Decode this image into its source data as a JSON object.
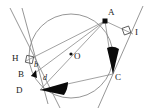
{
  "figure": {
    "type": "geometry-diagram",
    "background_color": "#ffffff",
    "stroke_color": "#777777",
    "marker_fill": "#000000",
    "label_color": "#1a1a1a"
  },
  "circle": {
    "label": "O",
    "center": {
      "x": 71,
      "y": 56
    },
    "radius": 42,
    "center_dot": true
  },
  "points": [
    {
      "name": "A",
      "label": "A",
      "x": 105,
      "y": 21,
      "marker": "filled-square",
      "label_dx": 3,
      "label_dy": -11
    },
    {
      "name": "I",
      "label": "I",
      "x": 133,
      "y": 34,
      "marker": "none",
      "label_dx": 4,
      "label_dy": -4
    },
    {
      "name": "C",
      "label": "C",
      "x": 113,
      "y": 74,
      "marker": "none",
      "label_dx": 3,
      "label_dy": 3
    },
    {
      "name": "O",
      "label": "O",
      "x": 71,
      "y": 56,
      "marker": "dot",
      "label_dx": 3,
      "label_dy": -3
    },
    {
      "name": "H",
      "label": "H",
      "x": 26,
      "y": 61,
      "marker": "none",
      "label_dx": -13,
      "label_dy": 0
    },
    {
      "name": "B",
      "label": "B",
      "x": 31,
      "y": 76,
      "marker": "none",
      "label_dx": -12,
      "label_dy": 2
    },
    {
      "name": "D",
      "label": "D",
      "x": 40,
      "y": 90,
      "marker": "none",
      "label_dx": -13,
      "label_dy": 3
    }
  ],
  "angle_labels": [
    {
      "name": "b",
      "label": "b",
      "x": 35,
      "y": 66
    },
    {
      "name": "d",
      "label": "d",
      "x": 44,
      "y": 79
    }
  ],
  "angle_markers": [
    {
      "name": "right-angle-H",
      "type": "square",
      "vertex": "H"
    },
    {
      "name": "right-angle-I",
      "type": "square",
      "vertex": "I"
    },
    {
      "name": "filled-angle-C",
      "type": "filled-wedge",
      "vertex": "C"
    },
    {
      "name": "filled-angle-D",
      "type": "filled-wedge",
      "vertex": "D"
    }
  ],
  "segments": [
    {
      "name": "A-H",
      "from": "A",
      "to": "H"
    },
    {
      "name": "A-B",
      "from": "A",
      "to": "B"
    },
    {
      "name": "A-D",
      "from": "A",
      "to": "D"
    },
    {
      "name": "A-C",
      "from": "A",
      "to": "C"
    },
    {
      "name": "A-I",
      "from": "A",
      "to": "I"
    },
    {
      "name": "D-C",
      "from": "D",
      "to": "C"
    },
    {
      "name": "H-D-extended",
      "from": "H",
      "to": "D"
    },
    {
      "name": "tangent-left",
      "from": "upper-left",
      "to": "lower-right"
    },
    {
      "name": "tangent-right",
      "from": "upper-right",
      "to": "lower-left"
    }
  ]
}
